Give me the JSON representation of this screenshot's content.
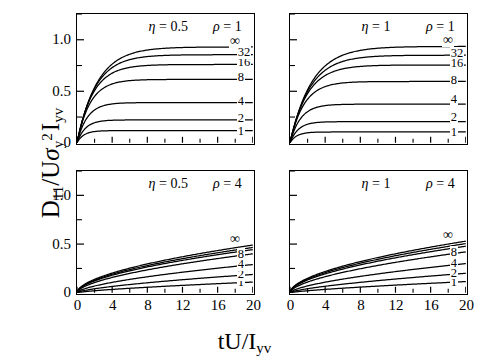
{
  "figure": {
    "ylabel_parts": {
      "d": "D",
      "d_sub": "11",
      "slash": "/U",
      "sigma": "σ",
      "sigma_sub": "y",
      "sigma_sup": "2",
      "i": "I",
      "i_sub": "yv"
    },
    "xlabel_parts": {
      "main": "tU/I",
      "sub": "yv"
    },
    "background": "#ffffff",
    "line_color": "#000000"
  },
  "chart_data": {
    "type": "line",
    "title": "",
    "xlabel": "tU/I_yv",
    "ylabel": "D_11/Uσ_y^2 I_yv",
    "xlim": [
      0,
      20
    ],
    "ylim": [
      0,
      1.25
    ],
    "xticks": [
      0,
      4,
      8,
      12,
      16,
      20
    ],
    "xtick_labels": [
      "0",
      "4",
      "8",
      "12",
      "16",
      "20"
    ],
    "xminor_step": 2,
    "yticks": [
      0,
      0.5,
      1.0
    ],
    "ytick_labels": [
      "0",
      "0.5",
      "1.0"
    ],
    "yminor": [
      0.25,
      0.75,
      1.25
    ],
    "grid": false,
    "legend_position": "inline-right",
    "panels": [
      {
        "id": "panel-top-left",
        "eta_label": "η = 0.5",
        "rho_label": "ρ = 1",
        "eta": 0.5,
        "rho": 1,
        "show_ytick_labels": true,
        "show_xtick_labels": false,
        "series": [
          {
            "name": "1",
            "label": "1",
            "plateau": 0.118,
            "rate": 1.3,
            "label_y": 0.118
          },
          {
            "name": "2",
            "label": "2",
            "plateau": 0.222,
            "rate": 1.05,
            "label_y": 0.245
          },
          {
            "name": "4",
            "label": "4",
            "plateau": 0.39,
            "rate": 0.85,
            "label_y": 0.415
          },
          {
            "name": "8",
            "label": "8",
            "plateau": 0.615,
            "rate": 0.66,
            "label_y": 0.64
          },
          {
            "name": "16",
            "label": "16",
            "plateau": 0.76,
            "rate": 0.55,
            "label_y": 0.79
          },
          {
            "name": "32",
            "label": "32",
            "plateau": 0.855,
            "rate": 0.48,
            "label_y": 0.885
          },
          {
            "name": "inf",
            "label": "∞",
            "plateau": 0.93,
            "rate": 0.43,
            "label_y": 0.985
          }
        ]
      },
      {
        "id": "panel-top-right",
        "eta_label": "η = 1",
        "rho_label": "ρ = 1",
        "eta": 1,
        "rho": 1,
        "show_ytick_labels": false,
        "show_xtick_labels": false,
        "series": [
          {
            "name": "1",
            "label": "1",
            "plateau": 0.105,
            "rate": 1.3,
            "label_y": 0.108
          },
          {
            "name": "2",
            "label": "2",
            "plateau": 0.205,
            "rate": 1.05,
            "label_y": 0.255
          },
          {
            "name": "4",
            "label": "4",
            "plateau": 0.375,
            "rate": 0.82,
            "label_y": 0.43
          },
          {
            "name": "8",
            "label": "8",
            "plateau": 0.595,
            "rate": 0.62,
            "label_y": 0.62
          },
          {
            "name": "16",
            "label": "16",
            "plateau": 0.755,
            "rate": 0.5,
            "label_y": 0.785
          },
          {
            "name": "32",
            "label": "32",
            "plateau": 0.85,
            "rate": 0.44,
            "label_y": 0.88
          },
          {
            "name": "inf",
            "label": "∞",
            "plateau": 0.935,
            "rate": 0.4,
            "label_y": 0.995
          }
        ]
      },
      {
        "id": "panel-bottom-left",
        "eta_label": "η = 0.5",
        "rho_label": "ρ = 4",
        "eta": 0.5,
        "rho": 4,
        "show_ytick_labels": true,
        "show_xtick_labels": true,
        "series": [
          {
            "name": "1",
            "label": "1",
            "end": 0.11,
            "power": 0.72,
            "label_y": 0.12
          },
          {
            "name": "2",
            "label": "2",
            "end": 0.188,
            "power": 0.66,
            "label_y": 0.198
          },
          {
            "name": "4",
            "label": "4",
            "end": 0.29,
            "power": 0.62,
            "label_y": 0.3
          },
          {
            "name": "8",
            "label": "8",
            "end": 0.4,
            "power": 0.58,
            "label_y": 0.408
          },
          {
            "name": "16",
            "label": "",
            "end": 0.443,
            "power": 0.56,
            "label_y": 0.45
          },
          {
            "name": "32",
            "label": "",
            "end": 0.465,
            "power": 0.555,
            "label_y": 0.47
          },
          {
            "name": "inf",
            "label": "∞",
            "end": 0.49,
            "power": 0.55,
            "label_y": 0.545
          }
        ]
      },
      {
        "id": "panel-bottom-right",
        "eta_label": "η = 1",
        "rho_label": "ρ = 4",
        "eta": 1,
        "rho": 4,
        "show_ytick_labels": false,
        "show_xtick_labels": true,
        "series": [
          {
            "name": "1",
            "label": "1",
            "end": 0.115,
            "power": 0.74,
            "label_y": 0.122
          },
          {
            "name": "2",
            "label": "2",
            "end": 0.2,
            "power": 0.68,
            "label_y": 0.212
          },
          {
            "name": "4",
            "label": "4",
            "end": 0.3,
            "power": 0.63,
            "label_y": 0.312
          },
          {
            "name": "8",
            "label": "8",
            "end": 0.42,
            "power": 0.58,
            "label_y": 0.43
          },
          {
            "name": "16",
            "label": "",
            "end": 0.478,
            "power": 0.56,
            "label_y": 0.484
          },
          {
            "name": "32",
            "label": "",
            "end": 0.505,
            "power": 0.555,
            "label_y": 0.51
          },
          {
            "name": "inf",
            "label": "∞",
            "end": 0.53,
            "power": 0.55,
            "label_y": 0.59
          }
        ]
      }
    ]
  }
}
